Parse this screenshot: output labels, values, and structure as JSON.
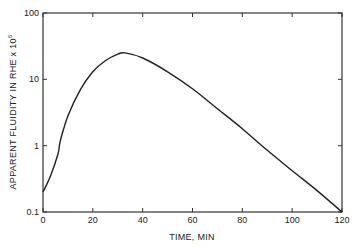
{
  "chart_data": {
    "type": "line",
    "title": "",
    "xlabel": "TIME, MIN",
    "ylabel": "APPARENT FLUIDITY IN RHE x 10^6",
    "ylabel_base": "APPARENT FLUIDITY IN RHE x 10",
    "ylabel_exp": "6",
    "yscale": "log",
    "xlim": [
      0,
      120
    ],
    "ylim": [
      0.1,
      100
    ],
    "x_ticks": [
      "0",
      "20",
      "40",
      "60",
      "80",
      "100",
      "120"
    ],
    "y_ticks": [
      "0.1",
      "1",
      "10",
      "100"
    ],
    "grid": false,
    "legend": null,
    "series": [
      {
        "name": "Apparent fluidity",
        "x": [
          0,
          3,
          6,
          7,
          10,
          15,
          20,
          25,
          30,
          33,
          40,
          50,
          60,
          70,
          80,
          90,
          100,
          110,
          120
        ],
        "values": [
          0.2,
          0.35,
          0.75,
          1.2,
          2.8,
          7,
          13,
          19,
          24,
          25,
          21,
          13,
          7.2,
          3.6,
          1.8,
          0.85,
          0.42,
          0.21,
          0.1
        ]
      }
    ]
  }
}
